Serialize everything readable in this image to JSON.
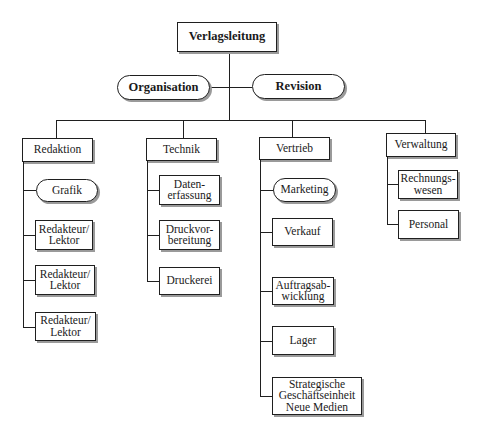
{
  "diagram": {
    "type": "organization-chart",
    "root": {
      "label": "Verlagsleitung"
    },
    "staff_units": [
      {
        "label": "Organisation"
      },
      {
        "label": "Revision"
      }
    ],
    "departments": [
      {
        "label": "Redaktion",
        "children": [
          {
            "label": "Grafik",
            "shape": "pill"
          },
          {
            "label": "Redakteur/\nLektor",
            "shape": "box"
          },
          {
            "label": "Redakteur/\nLektor",
            "shape": "box"
          },
          {
            "label": "Redakteur/\nLektor",
            "shape": "box"
          }
        ]
      },
      {
        "label": "Technik",
        "children": [
          {
            "label": "Daten-\nerfassung",
            "shape": "box"
          },
          {
            "label": "Druckvor-\nbereitung",
            "shape": "box"
          },
          {
            "label": "Druckerei",
            "shape": "box"
          }
        ]
      },
      {
        "label": "Vertrieb",
        "children": [
          {
            "label": "Marketing",
            "shape": "pill"
          },
          {
            "label": "Verkauf",
            "shape": "box"
          },
          {
            "label": "Auftragsab-\nwicklung",
            "shape": "box"
          },
          {
            "label": "Lager",
            "shape": "box"
          },
          {
            "label": "Strategische\nGeschäftseinheit\nNeue Medien",
            "shape": "box"
          }
        ]
      },
      {
        "label": "Verwaltung",
        "children": [
          {
            "label": "Rechnungs-\nwesen",
            "shape": "box"
          },
          {
            "label": "Personal",
            "shape": "box"
          }
        ]
      }
    ]
  },
  "colors": {
    "line": "#1f1f1f",
    "shadow": "#9a9a9a",
    "background": "#ffffff"
  }
}
